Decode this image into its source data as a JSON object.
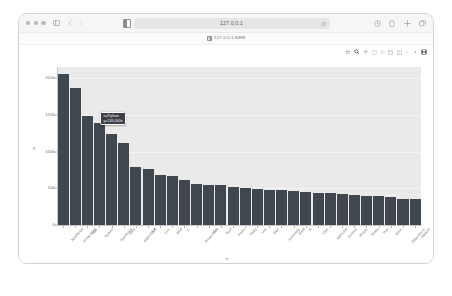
{
  "window": {
    "traffic_lights": [
      "close",
      "minimize",
      "maximize"
    ],
    "sidebar_toggle_label": "sidebar-toggle",
    "back_label": "Back",
    "forward_label": "Forward",
    "address": {
      "value": "127.0.0.1",
      "placeholder": "Search or enter website name",
      "reader_icon": "reader-view-icon",
      "reload_icon": "reload-icon"
    },
    "toolbar_right": [
      {
        "name": "share-icon",
        "glyph": "share"
      },
      {
        "name": "downloads-icon",
        "glyph": "download"
      },
      {
        "name": "new-tab-icon",
        "glyph": "plus"
      },
      {
        "name": "tab-overview-icon",
        "glyph": "tabs"
      }
    ],
    "bookmark": {
      "favicon": "page-favicon",
      "label": "127.0.0.1:8888"
    }
  },
  "mpl_toolbar": {
    "buttons": [
      {
        "name": "home-icon",
        "label": "Reset original view"
      },
      {
        "name": "zoom-icon",
        "label": "Zoom to rectangle"
      },
      {
        "name": "pan-icon",
        "label": "Pan axes"
      },
      {
        "name": "crosshair-icon",
        "label": "Crosshair"
      },
      {
        "name": "lasso-icon",
        "label": "Lasso select"
      },
      {
        "name": "box-select-icon",
        "label": "Box select"
      },
      {
        "name": "configure-icon",
        "label": "Configure subplots"
      },
      {
        "name": "reset-icon",
        "label": "Reset axes"
      },
      {
        "name": "autoscale-icon",
        "label": "Autoscale"
      },
      {
        "name": "save-icon",
        "label": "Save figure"
      }
    ]
  },
  "chart_data": {
    "type": "bar",
    "title": "",
    "xlabel": "x",
    "ylabel": "y",
    "grid": true,
    "legend_position": "none",
    "ylim": [
      0,
      215000
    ],
    "ytick_values": [
      0,
      50000,
      100000,
      150000,
      200000
    ],
    "ytick_labels": [
      "0",
      "50k",
      "100k",
      "150k",
      "200k"
    ],
    "bar_color": "#40474f",
    "plot_bg": "#eaeaea",
    "categories": [
      "JavaScript",
      "HTML/CSS",
      "SQL",
      "Python",
      "TypeScript",
      "Java",
      "Bash/Shell",
      "C#",
      "C++",
      "PHP",
      "C",
      "PowerShell",
      "Go",
      "Rust",
      "Kotlin",
      "Ruby",
      "Lua",
      "Dart",
      "Assembly",
      "Swift",
      "R",
      "VBA",
      "MATLAB",
      "Groovy",
      "Delphi",
      "Scala",
      "Perl",
      "Elixir",
      "Objective-C",
      "Haskell"
    ],
    "values": [
      205000,
      186000,
      148000,
      139000,
      124000,
      111000,
      79000,
      76000,
      68000,
      67000,
      61000,
      56000,
      55000,
      54000,
      52000,
      50000,
      49000,
      48000,
      47000,
      46000,
      45000,
      44000,
      43000,
      42000,
      41000,
      40000,
      39000,
      38000,
      36000,
      35000
    ]
  },
  "tooltip": {
    "lines": [
      "x=Python",
      "y=139,000s"
    ],
    "bar_index": 3
  },
  "caption": {
    "text": ""
  },
  "colors": {
    "bar": "#40474f",
    "plot_background": "#eaeaea",
    "grid": "#f4f4f4",
    "tooltip_bg": "#3c4046",
    "chrome_bg": "#f6f6f7"
  }
}
